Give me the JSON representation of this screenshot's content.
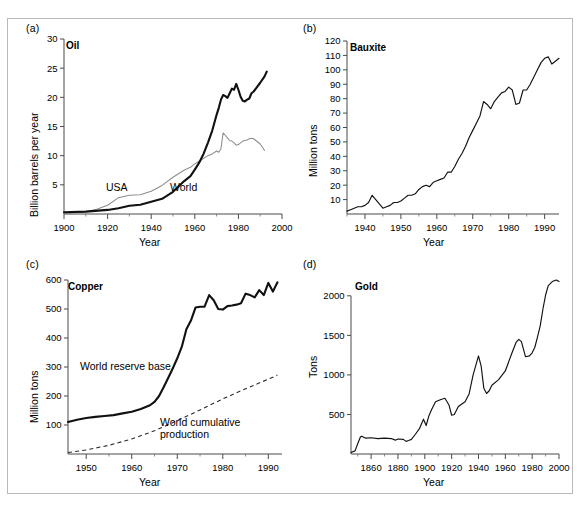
{
  "figure": {
    "panel_labels": [
      "(a)",
      "(b)",
      "(c)",
      "(d)"
    ]
  },
  "chart_data": [
    {
      "panel": "(a)",
      "type": "line",
      "title": "Oil",
      "xlabel": "Year",
      "ylabel": "Billion barrels per year",
      "xlim": [
        1900,
        2000
      ],
      "ylim": [
        0,
        30
      ],
      "xticks": [
        1900,
        1920,
        1940,
        1960,
        1980,
        2000
      ],
      "xtick_labels": [
        "1900",
        "1920",
        "1940",
        "1960",
        "1980",
        "2000"
      ],
      "xminor_step": 10,
      "yticks": [
        5,
        10,
        15,
        20,
        25,
        30
      ],
      "ytick_labels": [
        "5",
        "10",
        "15",
        "20",
        "25",
        "30"
      ],
      "grid": false,
      "legend": "inline-annotations",
      "series": [
        {
          "name": "USA",
          "style": "thin-gray",
          "annotation": "USA",
          "x": [
            1900,
            1905,
            1910,
            1915,
            1920,
            1925,
            1930,
            1935,
            1940,
            1945,
            1950,
            1955,
            1958,
            1960,
            1963,
            1966,
            1968,
            1970,
            1971,
            1972,
            1973,
            1974,
            1975,
            1976,
            1977,
            1978,
            1979,
            1980,
            1981,
            1982,
            1983,
            1984,
            1985,
            1986,
            1987,
            1988,
            1990,
            1992
          ],
          "y": [
            0.1,
            0.2,
            0.4,
            0.8,
            1.5,
            2.8,
            3.2,
            3.3,
            3.9,
            4.9,
            6.3,
            7.5,
            8.0,
            8.6,
            9.3,
            10.0,
            10.3,
            10.8,
            10.6,
            11.2,
            13.9,
            13.5,
            13.0,
            12.6,
            12.5,
            12.2,
            11.8,
            11.9,
            12.2,
            12.5,
            12.6,
            12.7,
            12.9,
            13.0,
            12.9,
            12.6,
            12.0,
            10.9
          ]
        },
        {
          "name": "World",
          "style": "thick-black",
          "annotation": "World",
          "x": [
            1900,
            1910,
            1920,
            1925,
            1930,
            1935,
            1940,
            1945,
            1950,
            1955,
            1958,
            1960,
            1962,
            1964,
            1966,
            1968,
            1970,
            1971,
            1972,
            1973,
            1974,
            1975,
            1976,
            1977,
            1978,
            1979,
            1980,
            1981,
            1982,
            1983,
            1984,
            1985,
            1986,
            1987,
            1988,
            1990,
            1992,
            1993
          ],
          "y": [
            0.3,
            0.4,
            0.7,
            1.0,
            1.4,
            1.6,
            2.1,
            2.6,
            3.8,
            5.6,
            6.5,
            7.6,
            8.8,
            10.3,
            12.2,
            14.3,
            17.0,
            18.2,
            19.6,
            20.4,
            20.2,
            19.9,
            20.7,
            21.5,
            21.3,
            22.3,
            21.3,
            20.1,
            19.4,
            19.3,
            19.6,
            19.8,
            20.7,
            21.0,
            21.5,
            22.5,
            23.6,
            24.4
          ]
        }
      ]
    },
    {
      "panel": "(b)",
      "type": "line",
      "title": "Bauxite",
      "xlabel": "Year",
      "ylabel": "Million tons",
      "xlim": [
        1935,
        1994
      ],
      "ylim": [
        0,
        120
      ],
      "xticks": [
        1940,
        1950,
        1960,
        1970,
        1980,
        1990
      ],
      "xtick_labels": [
        "1940",
        "1950",
        "1960",
        "1970",
        "1980",
        "1990"
      ],
      "xminor_step": 5,
      "yticks": [
        10,
        20,
        30,
        40,
        50,
        60,
        70,
        80,
        90,
        100,
        110,
        120
      ],
      "ytick_labels": [
        "10",
        "20",
        "30",
        "40",
        "50",
        "60",
        "70",
        "80",
        "90",
        "100",
        "110",
        "120"
      ],
      "grid": false,
      "series": [
        {
          "name": "Bauxite production",
          "style": "medium-black",
          "x": [
            1935,
            1936,
            1937,
            1938,
            1939,
            1940,
            1941,
            1942,
            1943,
            1944,
            1945,
            1946,
            1947,
            1948,
            1949,
            1950,
            1951,
            1952,
            1953,
            1954,
            1955,
            1956,
            1957,
            1958,
            1959,
            1960,
            1961,
            1962,
            1963,
            1964,
            1965,
            1966,
            1967,
            1968,
            1969,
            1970,
            1971,
            1972,
            1973,
            1974,
            1975,
            1976,
            1977,
            1978,
            1979,
            1980,
            1981,
            1982,
            1983,
            1984,
            1985,
            1986,
            1987,
            1988,
            1989,
            1990,
            1991,
            1992,
            1993,
            1994
          ],
          "y": [
            2,
            3,
            4,
            5,
            5,
            6,
            8,
            13,
            10,
            7,
            4,
            5,
            6,
            8,
            8,
            9,
            11,
            13,
            13,
            14,
            17,
            19,
            20,
            19,
            22,
            23,
            24,
            25,
            29,
            29,
            33,
            38,
            42,
            47,
            53,
            58,
            63,
            68,
            78,
            76,
            73,
            78,
            81,
            84,
            85,
            88,
            86,
            76,
            77,
            86,
            86,
            90,
            95,
            100,
            105,
            108,
            109,
            104,
            106,
            108
          ]
        }
      ]
    },
    {
      "panel": "(c)",
      "type": "line",
      "title": "Copper",
      "xlabel": "Year",
      "ylabel": "Million tons",
      "xlim": [
        1946,
        1993
      ],
      "ylim": [
        0,
        600
      ],
      "xticks": [
        1950,
        1960,
        1970,
        1980,
        1990
      ],
      "xtick_labels": [
        "1950",
        "1960",
        "1970",
        "1980",
        "1990"
      ],
      "xminor_step": 5,
      "yticks": [
        100,
        200,
        300,
        400,
        500,
        600
      ],
      "ytick_labels": [
        "100",
        "200",
        "300",
        "400",
        "500",
        "600"
      ],
      "grid": false,
      "legend": "inline-annotations",
      "series": [
        {
          "name": "World reserve base",
          "style": "thick-black",
          "annotation": "World reserve base",
          "x": [
            1946,
            1948,
            1950,
            1952,
            1954,
            1956,
            1958,
            1960,
            1962,
            1964,
            1965,
            1966,
            1967,
            1968,
            1969,
            1970,
            1971,
            1972,
            1973,
            1974,
            1975,
            1976,
            1977,
            1978,
            1979,
            1980,
            1981,
            1982,
            1983,
            1984,
            1985,
            1986,
            1987,
            1988,
            1989,
            1990,
            1991,
            1992
          ],
          "y": [
            110,
            118,
            124,
            128,
            131,
            134,
            140,
            146,
            155,
            168,
            180,
            200,
            230,
            262,
            295,
            330,
            370,
            430,
            460,
            505,
            508,
            508,
            548,
            530,
            500,
            498,
            510,
            512,
            515,
            520,
            553,
            548,
            540,
            565,
            548,
            590,
            560,
            592
          ]
        },
        {
          "name": "World cumulative production",
          "style": "dashed",
          "annotation": "World cumulative production",
          "x": [
            1946,
            1950,
            1955,
            1960,
            1965,
            1970,
            1975,
            1980,
            1985,
            1990,
            1992
          ],
          "y": [
            5,
            14,
            30,
            52,
            80,
            115,
            152,
            190,
            225,
            258,
            272
          ]
        }
      ]
    },
    {
      "panel": "(d)",
      "type": "line",
      "title": "Gold",
      "xlabel": "Year",
      "ylabel": "Tons",
      "xlim": [
        1845,
        2000
      ],
      "ylim": [
        0,
        2200
      ],
      "xticks": [
        1860,
        1880,
        1900,
        1920,
        1940,
        1960,
        1980,
        2000
      ],
      "xtick_labels": [
        "1860",
        "1880",
        "1900",
        "1920",
        "1940",
        "1960",
        "1980",
        "2000"
      ],
      "xminor_step": 10,
      "yticks": [
        500,
        1000,
        1500,
        2000
      ],
      "ytick_labels": [
        "500",
        "1000",
        "1500",
        "2000"
      ],
      "grid": false,
      "series": [
        {
          "name": "Gold production",
          "style": "medium-black",
          "x": [
            1845,
            1848,
            1850,
            1852,
            1853,
            1856,
            1860,
            1865,
            1870,
            1875,
            1878,
            1880,
            1884,
            1886,
            1888,
            1890,
            1893,
            1896,
            1899,
            1901,
            1903,
            1905,
            1908,
            1912,
            1915,
            1918,
            1920,
            1922,
            1925,
            1930,
            1933,
            1936,
            1940,
            1942,
            1944,
            1946,
            1948,
            1950,
            1955,
            1960,
            1965,
            1968,
            1970,
            1972,
            1975,
            1978,
            1980,
            1982,
            1984,
            1986,
            1988,
            1990,
            1992,
            1995,
            1998,
            2000
          ],
          "y": [
            20,
            40,
            130,
            215,
            225,
            200,
            205,
            195,
            200,
            195,
            175,
            190,
            185,
            160,
            170,
            185,
            250,
            320,
            440,
            360,
            480,
            560,
            660,
            690,
            705,
            620,
            490,
            500,
            600,
            660,
            760,
            1000,
            1240,
            1110,
            830,
            765,
            800,
            870,
            940,
            1050,
            1280,
            1410,
            1450,
            1420,
            1230,
            1240,
            1280,
            1350,
            1480,
            1620,
            1830,
            2010,
            2130,
            2180,
            2200,
            2180
          ]
        }
      ]
    }
  ]
}
